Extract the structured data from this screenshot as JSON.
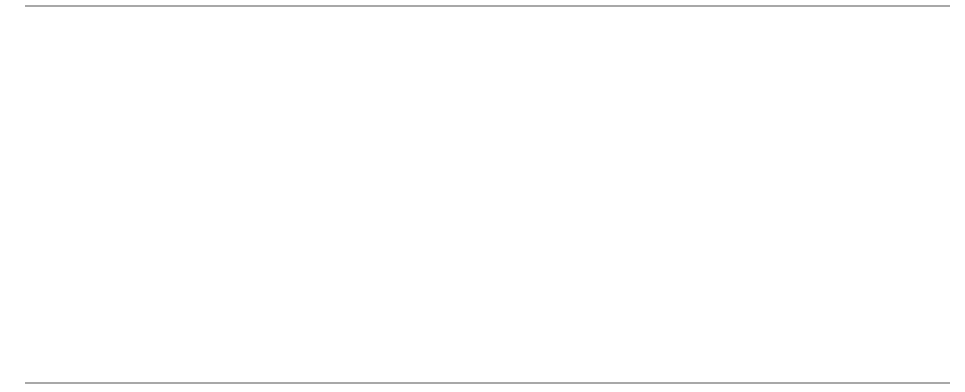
{
  "diagram": {
    "labels": {
      "tower_left": "towerLeft",
      "idx1": "[1]",
      "idx2": "[2]",
      "idx3": "[3]",
      "line_width": "lineWidth",
      "left_point": "(lineLeft, lineBot)",
      "right_point": "(lineRight, lineBot)"
    },
    "towers": [
      {
        "index": 1,
        "discs": 3
      },
      {
        "index": 2,
        "discs": 1
      },
      {
        "index": 3,
        "discs": 3
      }
    ],
    "colors": {
      "frame": "#000000",
      "arrow": "#444444",
      "rule": "#a8a8a8",
      "disc_dark": "#6e6e6e",
      "disc_light": "#f2f2f2"
    }
  }
}
